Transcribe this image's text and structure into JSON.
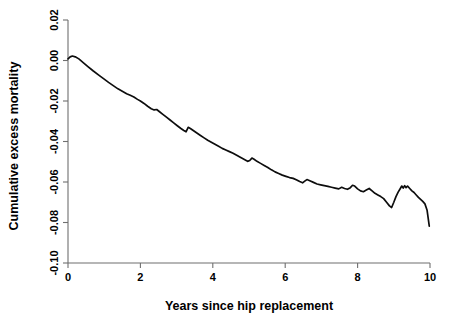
{
  "figure": {
    "background_color": "#ffffff",
    "line_color": "#0d0d0d",
    "axis_color": "#6f6f6f"
  },
  "chart_data": {
    "type": "line",
    "title": "",
    "subtitle": "",
    "xlabel": "Years since hip replacement",
    "ylabel": "Cumulative excess mortality",
    "xlim": [
      0,
      10
    ],
    "ylim": [
      -0.1,
      0.02
    ],
    "xticks": [
      0,
      2,
      4,
      6,
      8,
      10
    ],
    "xtick_labels": [
      "0",
      "2",
      "4",
      "6",
      "8",
      "10"
    ],
    "yticks": [
      0.02,
      0.0,
      -0.02,
      -0.04,
      -0.06,
      -0.08,
      -0.1
    ],
    "ytick_labels": [
      "0.02",
      "0.00",
      "-0.02",
      "-0.04",
      "-0.06",
      "-0.08",
      "-0.10"
    ],
    "grid": false,
    "legend": null,
    "legend_position": "none",
    "annotations": [],
    "series": [
      {
        "name": "Cumulative excess mortality",
        "color": "#0d0d0d",
        "x": [
          0.0,
          0.06,
          0.12,
          0.2,
          0.3,
          0.42,
          0.55,
          0.7,
          0.85,
          1.0,
          1.12,
          1.25,
          1.38,
          1.5,
          1.62,
          1.72,
          1.82,
          1.92,
          2.0,
          2.1,
          2.2,
          2.3,
          2.38,
          2.45,
          2.52,
          2.62,
          2.72,
          2.82,
          2.92,
          3.02,
          3.12,
          3.2,
          3.26,
          3.32,
          3.38,
          3.46,
          3.56,
          3.66,
          3.76,
          3.86,
          3.96,
          4.06,
          4.16,
          4.26,
          4.36,
          4.46,
          4.56,
          4.66,
          4.76,
          4.86,
          4.96,
          5.02,
          5.08,
          5.14,
          5.22,
          5.32,
          5.42,
          5.52,
          5.62,
          5.72,
          5.82,
          5.92,
          6.02,
          6.12,
          6.22,
          6.32,
          6.4,
          6.48,
          6.54,
          6.6,
          6.68,
          6.78,
          6.88,
          6.98,
          7.08,
          7.18,
          7.28,
          7.38,
          7.48,
          7.56,
          7.64,
          7.72,
          7.8,
          7.86,
          7.92,
          8.0,
          8.08,
          8.16,
          8.24,
          8.32,
          8.4,
          8.48,
          8.56,
          8.64,
          8.72,
          8.8,
          8.88,
          8.94,
          9.0,
          9.06,
          9.12,
          9.18,
          9.22,
          9.26,
          9.3,
          9.34,
          9.38,
          9.44,
          9.5,
          9.56,
          9.62,
          9.68,
          9.74,
          9.8,
          9.86,
          9.92,
          9.98
        ],
        "y": [
          0.0008,
          0.0018,
          0.0022,
          0.0018,
          0.0008,
          -0.001,
          -0.003,
          -0.0052,
          -0.0072,
          -0.0092,
          -0.0108,
          -0.0124,
          -0.014,
          -0.0152,
          -0.0164,
          -0.0172,
          -0.018,
          -0.0192,
          -0.02,
          -0.0212,
          -0.0226,
          -0.0238,
          -0.0244,
          -0.0242,
          -0.0252,
          -0.0266,
          -0.028,
          -0.0294,
          -0.0308,
          -0.0322,
          -0.0336,
          -0.0346,
          -0.0352,
          -0.033,
          -0.0336,
          -0.0346,
          -0.0358,
          -0.037,
          -0.0382,
          -0.0394,
          -0.0404,
          -0.0414,
          -0.0424,
          -0.0434,
          -0.0442,
          -0.045,
          -0.0458,
          -0.0468,
          -0.0478,
          -0.0488,
          -0.0498,
          -0.0494,
          -0.0482,
          -0.0488,
          -0.0498,
          -0.0508,
          -0.0518,
          -0.0528,
          -0.054,
          -0.055,
          -0.0558,
          -0.0566,
          -0.0572,
          -0.0578,
          -0.0582,
          -0.059,
          -0.0598,
          -0.0604,
          -0.0596,
          -0.0588,
          -0.0594,
          -0.0602,
          -0.061,
          -0.0614,
          -0.0618,
          -0.0622,
          -0.0626,
          -0.063,
          -0.0634,
          -0.0626,
          -0.0632,
          -0.0636,
          -0.0628,
          -0.0616,
          -0.062,
          -0.0634,
          -0.0644,
          -0.0648,
          -0.064,
          -0.0632,
          -0.0644,
          -0.0656,
          -0.0664,
          -0.0672,
          -0.0682,
          -0.07,
          -0.0718,
          -0.0726,
          -0.07,
          -0.0672,
          -0.065,
          -0.0632,
          -0.062,
          -0.063,
          -0.0618,
          -0.0628,
          -0.062,
          -0.0632,
          -0.0644,
          -0.0652,
          -0.0664,
          -0.0676,
          -0.0686,
          -0.0696,
          -0.0708,
          -0.074,
          -0.0818
        ]
      }
    ]
  }
}
